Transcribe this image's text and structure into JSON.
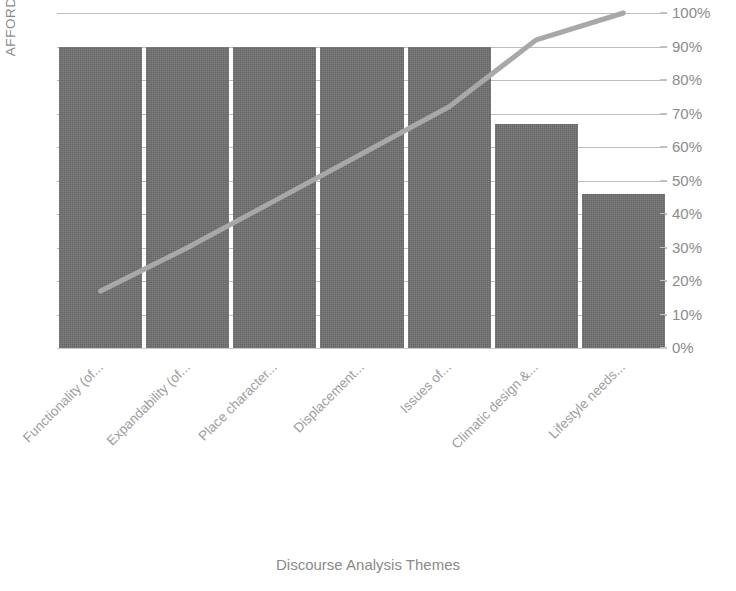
{
  "chart_data": {
    "type": "bar",
    "title": "",
    "xlabel": "Discourse Analysis Themes",
    "ylabel": "AFFORDANCES",
    "categories": [
      "Functionality (of...",
      "Expandability (of...",
      "Place character...",
      "Displacement...",
      "Issues of...",
      "Climatic design &...",
      "Lifestyle needs..."
    ],
    "values": [
      90,
      90,
      90,
      90,
      90,
      67,
      46
    ],
    "ytick_labels": [
      "100%",
      "90%",
      "80%",
      "70%",
      "60%",
      "50%",
      "40%",
      "30%",
      "20%",
      "10%",
      "0%"
    ],
    "ytick_values": [
      100,
      90,
      80,
      70,
      60,
      50,
      40,
      30,
      20,
      10,
      0
    ],
    "ylim": [
      0,
      100
    ],
    "grid": true,
    "legend": "none",
    "series": [
      {
        "name": "bars",
        "type": "bar",
        "values": [
          90,
          90,
          90,
          90,
          90,
          67,
          46
        ],
        "color": "#6f6f6f"
      },
      {
        "name": "cumulative line",
        "type": "line",
        "values": [
          17,
          30,
          44,
          58,
          72,
          92,
          100
        ],
        "color": "#a8a8a8"
      }
    ],
    "colors": {
      "bar": "#6f6f6f",
      "line": "#a8a8a8",
      "gridline": "#bdbdbd",
      "text": "#8c8c8c",
      "background": "#ffffff"
    }
  }
}
